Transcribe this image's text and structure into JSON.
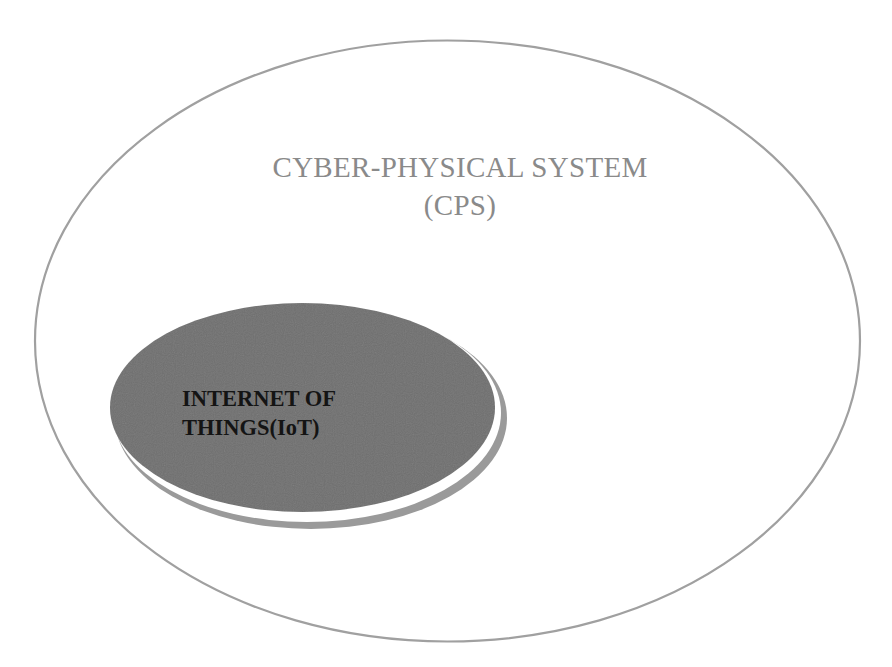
{
  "diagram": {
    "type": "nested-venn",
    "colors": {
      "background": "#ffffff",
      "outer_stroke": "#a0a0a0",
      "outer_label": "#8a8a8a",
      "inner_fill": "#6f6f6f",
      "inner_rim": "#9a9a9a",
      "inner_label": "#141414"
    },
    "outer": {
      "name": "cps",
      "label_lines": [
        "CYBER-PHYSICAL SYSTEM",
        "(CPS)"
      ]
    },
    "inner": {
      "name": "iot",
      "label_lines": [
        "INTERNET OF",
        "THINGS(IoT)"
      ]
    }
  }
}
